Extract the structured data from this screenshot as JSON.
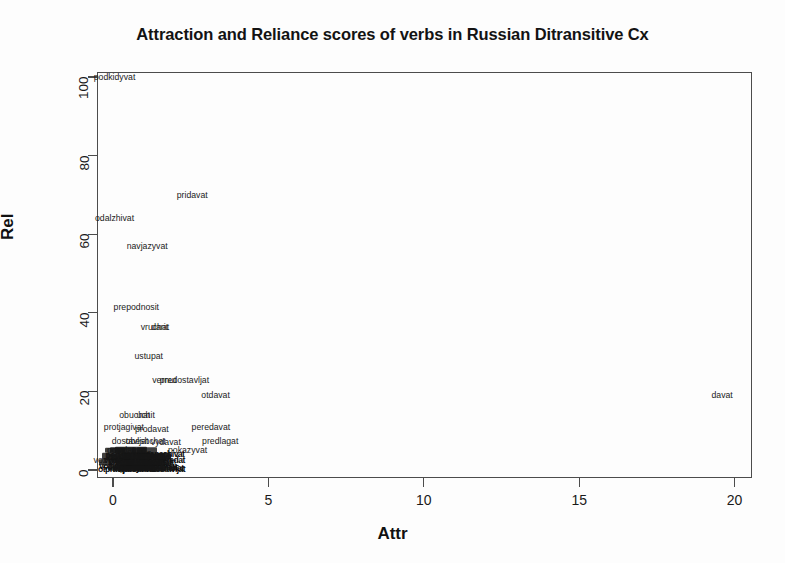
{
  "chart_data": {
    "type": "scatter",
    "title": "Attraction and Reliance scores of verbs in Russian Ditransitive Cx",
    "xlabel": "Attr",
    "ylabel": "Rel",
    "xlim": [
      -1.2,
      21.0
    ],
    "ylim": [
      -3.0,
      104.0
    ],
    "xticks": [
      0,
      5,
      10,
      15,
      20
    ],
    "yticks": [
      0,
      20,
      40,
      60,
      80,
      100
    ],
    "xtick_labels": [
      "0",
      "5",
      "10",
      "15",
      "20"
    ],
    "ytick_labels": [
      "0",
      "20",
      "40",
      "60",
      "80",
      "100"
    ],
    "grid": false,
    "legend": null,
    "marker_style": "text-labels",
    "points": [
      {
        "label": "podkidyvat",
        "x": 0.05,
        "y": 100.0
      },
      {
        "label": "pridavat",
        "x": 2.55,
        "y": 70.0
      },
      {
        "label": "odalzhivat",
        "x": 0.05,
        "y": 64.0
      },
      {
        "label": "navjazyvat",
        "x": 1.1,
        "y": 57.0
      },
      {
        "label": "prepodnosit",
        "x": 0.75,
        "y": 41.5
      },
      {
        "label": "vruchat",
        "x": 1.35,
        "y": 36.5
      },
      {
        "label": "darit",
        "x": 1.5,
        "y": 36.5
      },
      {
        "label": "ustupat",
        "x": 1.15,
        "y": 29.0
      },
      {
        "label": "vernut",
        "x": 1.65,
        "y": 23.0
      },
      {
        "label": "predostavljat",
        "x": 2.3,
        "y": 23.0
      },
      {
        "label": "otdavat",
        "x": 3.3,
        "y": 19.0
      },
      {
        "label": "davat",
        "x": 19.6,
        "y": 19.0
      },
      {
        "label": "obuchat",
        "x": 0.7,
        "y": 14.0
      },
      {
        "label": "uchit",
        "x": 1.05,
        "y": 14.0
      },
      {
        "label": "protjagivat",
        "x": 0.35,
        "y": 11.0
      },
      {
        "label": "prodavat",
        "x": 1.25,
        "y": 10.5
      },
      {
        "label": "peredavat",
        "x": 3.15,
        "y": 11.0
      },
      {
        "label": "predlagat",
        "x": 3.45,
        "y": 7.5
      },
      {
        "label": "dostavljat",
        "x": 0.55,
        "y": 7.5
      },
      {
        "label": "obeshchat",
        "x": 1.05,
        "y": 7.5
      },
      {
        "label": "vydavat",
        "x": 1.7,
        "y": 7.0
      },
      {
        "label": "pokazyvat",
        "x": 2.4,
        "y": 5.0
      },
      {
        "label": "posylat",
        "x": 0.25,
        "y": 5.0
      },
      {
        "label": "pokazat",
        "x": 1.55,
        "y": 2.0
      },
      {
        "label": "soobshchat",
        "x": 0.6,
        "y": 3.5
      },
      {
        "label": "vozvrashchat",
        "x": 0.2,
        "y": 2.5
      },
      {
        "label": "prinosit",
        "x": 0.9,
        "y": 1.5
      },
      {
        "label": "otpravljat",
        "x": 0.4,
        "y": 1.0
      },
      {
        "label": "sdavat",
        "x": 0.1,
        "y": 0.8
      },
      {
        "label": "podarit",
        "x": 0.65,
        "y": 0.5
      }
    ],
    "dense_cluster_note": "Large number of overlapping verb labels near the origin (Attr 0-2, Rel 0-8) forming a solid black band."
  },
  "axis": {
    "ylabel": "Rel",
    "xlabel": "Attr"
  }
}
